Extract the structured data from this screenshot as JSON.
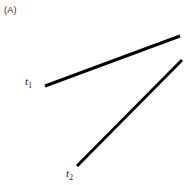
{
  "figure": {
    "panel_label": "(A)",
    "background_color": "#ffffff",
    "line_color": "#000000",
    "label_color": "#111111",
    "panel_label_color": "#2b2b2b",
    "width": 194,
    "height": 185
  },
  "chart_data": {
    "type": "line",
    "title": "(A)",
    "xlabel": "",
    "ylabel": "",
    "grid": false,
    "axes_visible": false,
    "legend": "inline-endpoint-labels",
    "xlim": [
      0,
      194
    ],
    "ylim": [
      185,
      0
    ],
    "annotations": [
      {
        "name": "panel-label",
        "text": "(A)",
        "x": 4,
        "y": 12
      }
    ],
    "series": [
      {
        "name": "t1",
        "label": "t",
        "label_subscript": "1",
        "label_x": 27,
        "label_y": 84,
        "stroke_width": 3,
        "color": "#000000",
        "x": [
          45,
          180
        ],
        "y": [
          86,
          36
        ]
      },
      {
        "name": "t2",
        "label": "t",
        "label_subscript": "2",
        "label_x": 68,
        "label_y": 176,
        "stroke_width": 3,
        "color": "#000000",
        "x": [
          77,
          182
        ],
        "y": [
          166,
          60
        ]
      }
    ]
  },
  "labels": {
    "t1": {
      "base": "t",
      "sub": "1"
    },
    "t2": {
      "base": "t",
      "sub": "2"
    }
  }
}
